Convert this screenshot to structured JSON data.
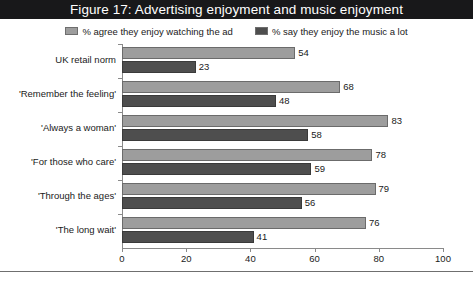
{
  "figure": {
    "title": "Figure 17: Advertising enjoyment and music enjoyment"
  },
  "colors": {
    "title_bar_bg": "#18181a",
    "title_bar_text": "#ffffff",
    "series_0": "#9d9d9d",
    "series_1": "#4e4e4e",
    "axis": "#8a8a8a",
    "text": "#1a1a1a"
  },
  "chart_data": {
    "type": "bar",
    "orientation": "horizontal",
    "title": "Figure 17: Advertising enjoyment and music enjoyment",
    "xlabel": "",
    "ylabel": "",
    "xlim": [
      0,
      100
    ],
    "xticks": [
      0,
      20,
      40,
      60,
      80,
      100
    ],
    "grid": false,
    "legend_position": "top-center",
    "categories": [
      "UK retail norm",
      "'Remember the feeling'",
      "'Always a woman'",
      "'For those who care'",
      "'Through the ages'",
      "'The long wait'"
    ],
    "series": [
      {
        "name": "% agree they enjoy watching the ad",
        "color": "#9d9d9d",
        "values": [
          54,
          68,
          83,
          78,
          79,
          76
        ]
      },
      {
        "name": "% say they enjoy the music a lot",
        "color": "#4e4e4e",
        "values": [
          23,
          48,
          58,
          59,
          56,
          41
        ]
      }
    ]
  }
}
